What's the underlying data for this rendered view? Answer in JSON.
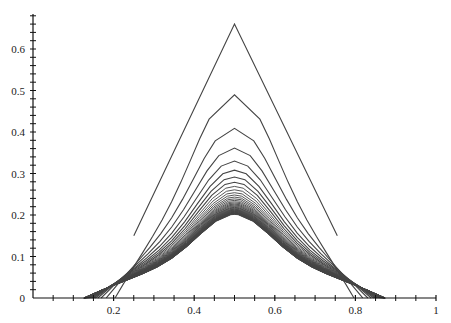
{
  "chart_data": {
    "type": "line",
    "title": "",
    "xlabel": "",
    "ylabel": "",
    "xlim": [
      0,
      1
    ],
    "ylim": [
      0,
      0.7
    ],
    "grid": false,
    "legend": null,
    "x_ticks": [
      "0.2",
      "0.4",
      "0.6",
      "0.8",
      "1"
    ],
    "y_ticks": [
      "0",
      "0.1",
      "0.2",
      "0.3",
      "0.4",
      "0.5",
      "0.6"
    ],
    "series_summary": {
      "count": 40,
      "center_x": 0.5,
      "first_peak": 0.66,
      "second_peak": 0.55,
      "third_peak": 0.48,
      "limit_peak": 0.18,
      "support_min_x": 0.12,
      "support_max_x": 0.88,
      "first_curve": [
        [
          0.25,
          0.15
        ],
        [
          0.5,
          0.66
        ],
        [
          0.755,
          0.15
        ]
      ]
    },
    "line_color": "#444444"
  }
}
